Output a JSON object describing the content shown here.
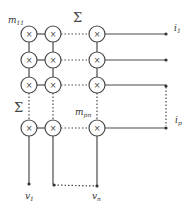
{
  "diagram": {
    "stroke_color": "#4a4a4a",
    "node_symbol": "×",
    "sum_symbol": "Σ",
    "labels": {
      "top_left_weight": {
        "base": "m",
        "sub": "11"
      },
      "bottom_right_weight": {
        "base": "m",
        "sub": "pn"
      },
      "top_sum": "Σ",
      "left_sum": "Σ",
      "input_first": {
        "base": "v",
        "sub": "1"
      },
      "input_last": {
        "base": "v",
        "sub": "n"
      },
      "output_first": {
        "base": "i",
        "sub": "1"
      },
      "output_last": {
        "base": "i",
        "sub": "p"
      }
    },
    "columns": [
      "v1",
      "v2",
      "vn"
    ],
    "rows": [
      "i1",
      "i2",
      "i3",
      "ip"
    ]
  }
}
